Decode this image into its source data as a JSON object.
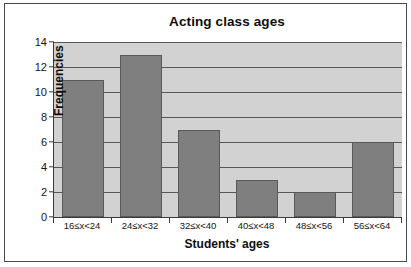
{
  "chart_data": {
    "type": "bar",
    "title": "Acting class ages",
    "xlabel": "Students' ages",
    "ylabel": "Frequencies",
    "categories": [
      "16≤x<24",
      "24≤x<32",
      "32≤x<40",
      "40≤x<48",
      "48≤x<56",
      "56≤x<64"
    ],
    "values": [
      11,
      13,
      7,
      3,
      2,
      6
    ],
    "ylim": [
      0,
      14
    ],
    "ytick_step": 2,
    "yticks": [
      0,
      2,
      4,
      6,
      8,
      10,
      12,
      14
    ],
    "ytick_labels": [
      "0",
      "2",
      "4",
      "6",
      "8",
      "10",
      "12",
      "14"
    ],
    "grid": "horizontal",
    "legend": "none",
    "colors": {
      "bar_fill": "#7f7f7f",
      "bar_edge": "#595959",
      "plot_background": "#d2d2d2",
      "gridline": "#565656",
      "axis": "#3a3a3a",
      "text": "#151515",
      "frame": "#4a4a4a",
      "figure_background": "#ffffff"
    }
  }
}
